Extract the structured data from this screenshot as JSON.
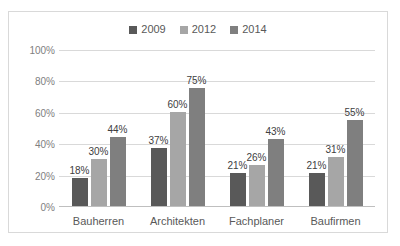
{
  "chart_data": {
    "type": "bar",
    "title": "",
    "subtitle": "",
    "xlabel": "",
    "ylabel": "",
    "categories": [
      "Bauherren",
      "Architekten",
      "Fachplaner",
      "Baufirmen"
    ],
    "series": [
      {
        "name": "2009",
        "color": "#595959",
        "values": [
          18,
          30,
          21,
          21
        ]
      },
      {
        "name": "2012",
        "color": "#a6a6a6",
        "values": [
          30,
          60,
          26,
          31
        ]
      },
      {
        "name": "2014",
        "color": "#7f7f7f",
        "values": [
          44,
          75,
          43,
          55
        ]
      }
    ],
    "value_labels": [
      [
        "18%",
        "30%",
        "44%"
      ],
      [
        "37%",
        "60%",
        "75%"
      ],
      [
        "21%",
        "26%",
        "43%"
      ],
      [
        "21%",
        "31%",
        "55%"
      ]
    ],
    "ylim": [
      0,
      100
    ],
    "y_ticks": [
      {
        "value": 100,
        "label": "100%"
      },
      {
        "value": 80,
        "label": "80%"
      },
      {
        "value": 60,
        "label": "60%"
      },
      {
        "value": 40,
        "label": "40%"
      },
      {
        "value": 20,
        "label": "20%"
      },
      {
        "value": 0,
        "label": "0%"
      }
    ],
    "grid": true,
    "legend_position": "top",
    "legend": [
      "2009",
      "2012",
      "2014"
    ],
    "data": [
      {
        "category": "Bauherren",
        "2009": 18,
        "2012": 30,
        "2014": 44
      },
      {
        "category": "Architekten",
        "2009": 37,
        "2012": 60,
        "2014": 75
      },
      {
        "category": "Fachplaner",
        "2009": 21,
        "2012": 26,
        "2014": 43
      },
      {
        "category": "Baufirmen",
        "2009": 21,
        "2012": 31,
        "2014": 55
      }
    ]
  },
  "legend": {
    "items": [
      {
        "label": "2009",
        "color": "#595959"
      },
      {
        "label": "2012",
        "color": "#a6a6a6"
      },
      {
        "label": "2014",
        "color": "#7f7f7f"
      }
    ]
  },
  "axes": {
    "y_ticks": [
      "100%",
      "80%",
      "60%",
      "40%",
      "20%",
      "0%"
    ],
    "x_ticks": [
      "Bauherren",
      "Architekten",
      "Fachplaner",
      "Baufirmen"
    ]
  },
  "colors": {
    "frame_border": "#d9d9d9",
    "gridline": "#d9d9d9",
    "baseline": "#bfbfbf",
    "tick_text": "#808080",
    "label_text": "#404040",
    "category_text": "#595959",
    "background": "#ffffff"
  }
}
